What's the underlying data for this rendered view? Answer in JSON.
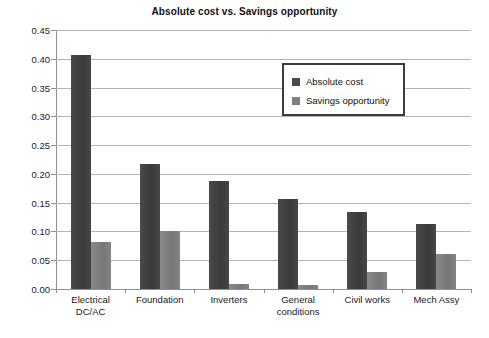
{
  "chart_data": {
    "type": "bar",
    "title": "Absolute cost vs. Savings opportunity",
    "xlabel": "",
    "ylabel": "",
    "ylim": [
      0,
      0.45
    ],
    "ytick_step": 0.05,
    "grid": true,
    "legend_position": "inside-top-right",
    "categories": [
      "Electrical\nDC/AC",
      "Foundation",
      "Inverters",
      "General\nconditions",
      "Civil works",
      "Mech Assy"
    ],
    "ytick_labels": [
      "0.45",
      "0.40",
      "0.35",
      "0.30",
      "0.25",
      "0.20",
      "0.15",
      "0.10",
      "0.05",
      "0.00"
    ],
    "ytick_values": [
      0.45,
      0.4,
      0.35,
      0.3,
      0.25,
      0.2,
      0.15,
      0.1,
      0.05,
      0.0
    ],
    "series": [
      {
        "name": "Absolute cost",
        "color": "#4a4a4a",
        "values": [
          0.407,
          0.218,
          0.187,
          0.156,
          0.134,
          0.113
        ]
      },
      {
        "name": "Savings opportunity",
        "color": "#7f7f7f",
        "values": [
          0.082,
          0.1,
          0.009,
          0.007,
          0.03,
          0.06
        ]
      }
    ]
  }
}
